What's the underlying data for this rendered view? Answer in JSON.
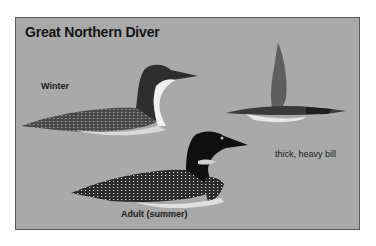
{
  "title": "Great Northern Diver",
  "labels": {
    "winter": "Winter",
    "adult_summer": "Adult (summer)",
    "bill_note": "thick, heavy bill"
  },
  "colors": {
    "background": "#a9a9a9",
    "border": "#5a5a5a",
    "text": "#151515"
  }
}
